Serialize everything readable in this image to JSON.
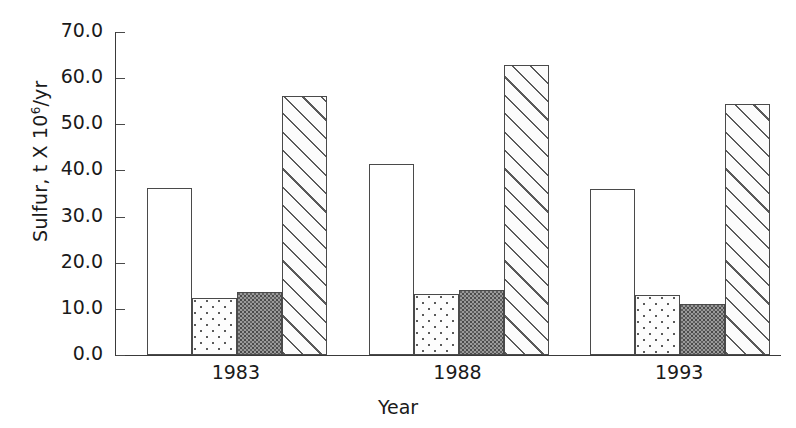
{
  "chart_data": {
    "type": "bar",
    "title": "",
    "xlabel": "Year",
    "ylabel": "Sulfur, t X 10",
    "ylabel_exponent": "6",
    "ylabel_suffix": "/yr",
    "categories": [
      "1983",
      "1988",
      "1993"
    ],
    "ylim": [
      0.0,
      70.0
    ],
    "ytick_labels": [
      "0.0",
      "10.0",
      "20.0",
      "30.0",
      "40.0",
      "50.0",
      "60.0",
      "70.0"
    ],
    "ytick_values": [
      0.0,
      10.0,
      20.0,
      30.0,
      40.0,
      50.0,
      60.0,
      70.0
    ],
    "grid": false,
    "legend": "none",
    "series": [
      {
        "name": "series-1-white",
        "pattern": "open-white",
        "values": [
          36.3,
          41.5,
          36.0
        ]
      },
      {
        "name": "series-2-dotted",
        "pattern": "dotted",
        "values": [
          12.3,
          13.2,
          13.0
        ]
      },
      {
        "name": "series-3-dark",
        "pattern": "dark-stipple",
        "values": [
          13.6,
          14.1,
          11.0
        ]
      },
      {
        "name": "series-4-hatch",
        "pattern": "diagonal-hatch",
        "values": [
          56.2,
          62.8,
          54.5
        ]
      }
    ]
  },
  "colors": {
    "axis": "#3a3a3a",
    "tick": "#4a4a4a",
    "text": "#1a1a1a",
    "bar_outline": "#4a4a4a",
    "fill_white": "#ffffff",
    "fill_dark": "#9a9a9a",
    "background": "#ffffff"
  }
}
